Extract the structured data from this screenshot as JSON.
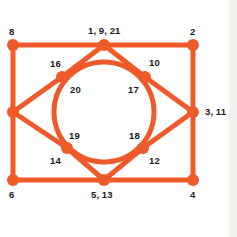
{
  "diagram": {
    "type": "node-link-graph",
    "colors": {
      "edge": "#ef5a2a",
      "node": "#ef5a2a",
      "label": "#1b1b1b",
      "background": "#ffffff",
      "side_strip": "#f2f1ee"
    },
    "geometry": {
      "width": 237,
      "height": 237,
      "edge_width": 5,
      "node_radius": 6,
      "circle_center": [
        104,
        112
      ],
      "circle_radius": 50
    },
    "nodes": [
      {
        "id": "n-tl",
        "name": "node-top-left",
        "label": "8",
        "x": 13,
        "y": 45,
        "label_x": 9,
        "label_y": 27,
        "label_align": "left"
      },
      {
        "id": "n-tc",
        "name": "node-top-center",
        "label": "1, 9, 21",
        "x": 104,
        "y": 45,
        "label_x": 88,
        "label_y": 26,
        "label_align": "left"
      },
      {
        "id": "n-tr",
        "name": "node-top-right",
        "label": "2",
        "x": 193,
        "y": 45,
        "label_x": 190,
        "label_y": 27,
        "label_align": "left"
      },
      {
        "id": "n-ml",
        "name": "node-middle-left",
        "label": "",
        "x": 13,
        "y": 112,
        "label_x": 0,
        "label_y": 0,
        "label_align": "left"
      },
      {
        "id": "n-mr",
        "name": "node-middle-right",
        "label": "3, 11",
        "x": 193,
        "y": 112,
        "label_x": 205,
        "label_y": 107,
        "label_align": "left"
      },
      {
        "id": "n-bl",
        "name": "node-bottom-left",
        "label": "6",
        "x": 13,
        "y": 180,
        "label_x": 9,
        "label_y": 190,
        "label_align": "left"
      },
      {
        "id": "n-bc",
        "name": "node-bottom-center",
        "label": "5, 13",
        "x": 104,
        "y": 180,
        "label_x": 91,
        "label_y": 190,
        "label_align": "left"
      },
      {
        "id": "n-br",
        "name": "node-bottom-right",
        "label": "4",
        "x": 193,
        "y": 180,
        "label_x": 190,
        "label_y": 190,
        "label_align": "left"
      },
      {
        "id": "n-iul",
        "name": "node-inner-upper-left",
        "label": "16",
        "x": 62,
        "y": 77,
        "label_x": 50,
        "label_y": 59,
        "label_align": "left"
      },
      {
        "id": "n-iur",
        "name": "node-inner-upper-right",
        "label": "10",
        "x": 145,
        "y": 77,
        "label_x": 149,
        "label_y": 58,
        "label_align": "left"
      },
      {
        "id": "n-ill",
        "name": "node-inner-lower-left",
        "label": "19",
        "x": 67,
        "y": 148,
        "label_x": 69,
        "label_y": 131,
        "label_align": "left"
      },
      {
        "id": "n-ilr",
        "name": "node-inner-lower-right",
        "label": "18",
        "x": 143,
        "y": 148,
        "label_x": 129,
        "label_y": 131,
        "label_align": "left"
      }
    ],
    "secondary_labels": [
      {
        "name": "label-20",
        "label": "20",
        "x": 70,
        "y": 85
      },
      {
        "name": "label-17",
        "label": "17",
        "x": 128,
        "y": 85
      },
      {
        "name": "label-14",
        "label": "14",
        "x": 50,
        "y": 156
      },
      {
        "name": "label-12",
        "label": "12",
        "x": 149,
        "y": 156
      }
    ],
    "edges": [
      {
        "name": "edge-top",
        "from": "n-tl",
        "to": "n-tc"
      },
      {
        "name": "edge-top-2",
        "from": "n-tc",
        "to": "n-tr"
      },
      {
        "name": "edge-left",
        "from": "n-tl",
        "to": "n-ml"
      },
      {
        "name": "edge-left-2",
        "from": "n-ml",
        "to": "n-bl"
      },
      {
        "name": "edge-right",
        "from": "n-tr",
        "to": "n-mr"
      },
      {
        "name": "edge-right-2",
        "from": "n-mr",
        "to": "n-br"
      },
      {
        "name": "edge-bottom",
        "from": "n-bl",
        "to": "n-bc"
      },
      {
        "name": "edge-bottom-2",
        "from": "n-bc",
        "to": "n-br"
      },
      {
        "name": "edge-tc-iul",
        "from": "n-tc",
        "to": "n-iul"
      },
      {
        "name": "edge-iul-ml",
        "from": "n-iul",
        "to": "n-ml"
      },
      {
        "name": "edge-tc-iur",
        "from": "n-tc",
        "to": "n-iur"
      },
      {
        "name": "edge-iur-mr",
        "from": "n-iur",
        "to": "n-mr"
      },
      {
        "name": "edge-ml-ill",
        "from": "n-ml",
        "to": "n-ill"
      },
      {
        "name": "edge-ill-bc",
        "from": "n-ill",
        "to": "n-bc"
      },
      {
        "name": "edge-mr-ilr",
        "from": "n-mr",
        "to": "n-ilr"
      },
      {
        "name": "edge-ilr-bc",
        "from": "n-ilr",
        "to": "n-bc"
      }
    ],
    "circle_arcs": [
      {
        "name": "arc-circle",
        "center": [
          104,
          112
        ],
        "r": 50
      }
    ]
  }
}
